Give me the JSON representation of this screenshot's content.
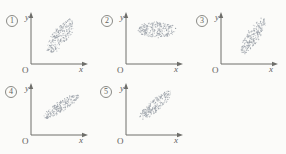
{
  "figure": {
    "kind": "multiple-choice-scatter-options",
    "background_color": "#fbfbf9",
    "dot_color": "#9aa0a8",
    "axis_color": "#6e6e6a",
    "label_color": "#5f5f5c",
    "origin_label": "O",
    "x_axis_label": "x",
    "y_axis_label": "y"
  },
  "chart_data": {
    "type": "scatter",
    "title": "",
    "xlabel": "x",
    "ylabel": "y",
    "grid": false,
    "legend": "none",
    "panel_layout": {
      "rows": 2,
      "cols": 3,
      "top_row": [
        1,
        2,
        3
      ],
      "bottom_row": [
        4,
        5
      ]
    },
    "panels": [
      {
        "id": 1,
        "marker": "1",
        "marker_label": "①",
        "origin_label": "O",
        "xlabel": "x",
        "ylabel": "y",
        "description": "negative correlation, broad tilted ellipse sloping down to the right",
        "correlation": "negative",
        "correlation_estimate": -0.75,
        "ellipse": {
          "cx": 0.5,
          "cy": 0.46,
          "rx": 0.36,
          "ry": 0.165,
          "angle_deg": -52
        },
        "n_points": 260
      },
      {
        "id": 2,
        "marker": "2",
        "marker_label": "②",
        "origin_label": "O",
        "xlabel": "x",
        "ylabel": "y",
        "description": "no correlation, wide horizontal ellipse",
        "correlation": "none",
        "correlation_estimate": 0.0,
        "ellipse": {
          "cx": 0.53,
          "cy": 0.33,
          "rx": 0.34,
          "ry": 0.155,
          "angle_deg": 0
        },
        "n_points": 280
      },
      {
        "id": 3,
        "marker": "3",
        "marker_label": "③",
        "origin_label": "O",
        "xlabel": "x",
        "ylabel": "y",
        "description": "strong positive correlation, steep narrow ellipse rising to the right",
        "correlation": "positive",
        "correlation_estimate": 0.88,
        "ellipse": {
          "cx": 0.55,
          "cy": 0.45,
          "rx": 0.38,
          "ry": 0.125,
          "angle_deg": -58
        },
        "n_points": 250
      },
      {
        "id": 4,
        "marker": "4",
        "marker_label": "④",
        "origin_label": "O",
        "xlabel": "x",
        "ylabel": "y",
        "description": "positive correlation, shallow narrow band rising to the right",
        "correlation": "positive",
        "correlation_estimate": 0.85,
        "ellipse": {
          "cx": 0.52,
          "cy": 0.44,
          "rx": 0.38,
          "ry": 0.105,
          "angle_deg": -33
        },
        "n_points": 250
      },
      {
        "id": 5,
        "marker": "5",
        "marker_label": "⑤",
        "origin_label": "O",
        "xlabel": "x",
        "ylabel": "y",
        "description": "negative correlation, narrow band sloping down to the right",
        "correlation": "negative",
        "correlation_estimate": -0.86,
        "ellipse": {
          "cx": 0.5,
          "cy": 0.42,
          "rx": 0.37,
          "ry": 0.11,
          "angle_deg": -42
        },
        "n_points": 250
      }
    ]
  }
}
